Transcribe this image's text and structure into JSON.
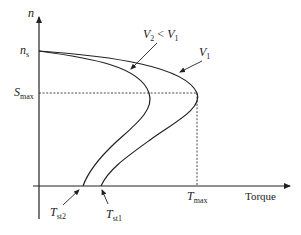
{
  "diagram": {
    "y_axis_label": "n",
    "x_axis_label": "Torque",
    "labels": {
      "ns_main": "n",
      "ns_sub": "s",
      "smax_main": "S",
      "smax_sub": "max",
      "tmax_main": "T",
      "tmax_sub": "max",
      "tst1_main": "T",
      "tst1_sub": "st1",
      "tst2_main": "T",
      "tst2_sub": "st2",
      "v1_main": "V",
      "v1_sub": "1",
      "v2_main": "V",
      "v2_sub": "2",
      "v2_rel": " < ",
      "v2_rhs_main": "V",
      "v2_rhs_sub": "1"
    },
    "curves": [
      {
        "name": "V1",
        "peak_torque": "T_max",
        "start_torque": "T_st1"
      },
      {
        "name": "V2 < V1",
        "peak_torque": "lower",
        "start_torque": "T_st2"
      }
    ],
    "colors": {
      "line": "#222222",
      "background": "#ffffff"
    }
  }
}
